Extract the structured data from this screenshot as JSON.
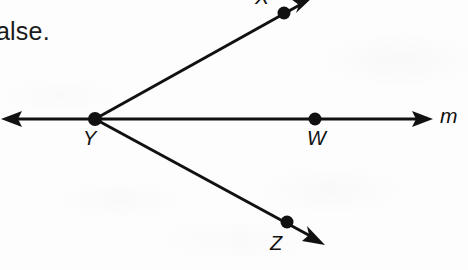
{
  "page": {
    "kind": "scanned-textbook-geometry-figure",
    "width": 468,
    "height": 270,
    "background_color": "#fdfdfd",
    "ink_color": "#111111"
  },
  "truncated_text": {
    "visible": "alse.",
    "note": "left-cropped remainder of a sentence ending in the word false."
  },
  "figure": {
    "vertex": {
      "label": "Y",
      "x": 95,
      "y": 119
    },
    "points": [
      {
        "name": "X",
        "label": "X",
        "x": 284,
        "y": 13,
        "label_x": 255,
        "label_y": -15
      },
      {
        "name": "W",
        "label": "W",
        "x": 315,
        "y": 119,
        "label_x": 307,
        "label_y": 127
      },
      {
        "name": "Z",
        "label": "Z",
        "x": 287,
        "y": 222,
        "label_x": 270,
        "label_y": 232
      },
      {
        "name": "Y",
        "label": "Y",
        "x": 95,
        "y": 119,
        "label_x": 83,
        "label_y": 127
      }
    ],
    "line_label": {
      "text": "m",
      "x": 440,
      "y": 104
    },
    "lines": [
      {
        "name": "line-m",
        "from_x": 2,
        "from_y": 119,
        "to_x": 432,
        "to_y": 119,
        "arrow_start": true,
        "arrow_end": true,
        "stroke_width": 3
      },
      {
        "name": "ray-YX",
        "from_x": 95,
        "from_y": 119,
        "to_x": 312,
        "to_y": -2,
        "arrow_start": false,
        "arrow_end": true,
        "stroke_width": 3
      },
      {
        "name": "ray-YZ",
        "from_x": 95,
        "from_y": 119,
        "to_x": 324,
        "to_y": 244,
        "arrow_start": false,
        "arrow_end": true,
        "stroke_width": 3
      }
    ],
    "dot_radius": 6
  }
}
